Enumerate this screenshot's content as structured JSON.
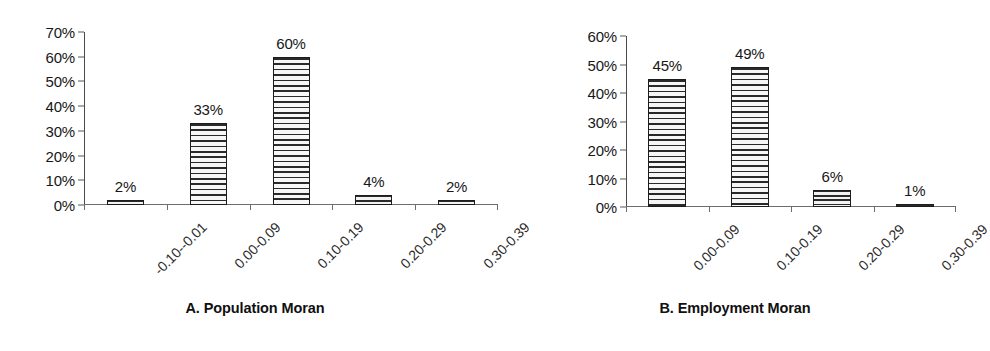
{
  "figure": {
    "background": "#ffffff",
    "bar_fill": "#f7f7f7",
    "bar_hatch_color": "#2a2a2a",
    "bar_border_color": "#1c1c1c",
    "axis_color": "#585858"
  },
  "chart_data": [
    {
      "type": "bar",
      "id": "population-moran",
      "title": "A. Population Moran",
      "xlabel": "",
      "ylabel": "",
      "ylim": [
        0,
        70
      ],
      "ytick_labels": [
        "0%",
        "10%",
        "20%",
        "30%",
        "40%",
        "50%",
        "60%",
        "70%"
      ],
      "ytick_values": [
        0,
        10,
        20,
        30,
        40,
        50,
        60,
        70
      ],
      "grid": false,
      "legend": null,
      "categories": [
        "-0.10--0.01",
        "0.00-0.09",
        "0.10-0.19",
        "0.20-0.29",
        "0.30-0.39"
      ],
      "values": [
        2,
        33,
        60,
        4,
        2
      ],
      "data_labels": [
        "2%",
        "33%",
        "60%",
        "4%",
        "2%"
      ]
    },
    {
      "type": "bar",
      "id": "employment-moran",
      "title": "B. Employment Moran",
      "xlabel": "",
      "ylabel": "",
      "ylim": [
        0,
        60
      ],
      "ytick_labels": [
        "0%",
        "10%",
        "20%",
        "30%",
        "40%",
        "50%",
        "60%"
      ],
      "ytick_values": [
        0,
        10,
        20,
        30,
        40,
        50,
        60
      ],
      "grid": false,
      "legend": null,
      "categories": [
        "0.00-0.09",
        "0.10-0.19",
        "0.20-0.29",
        "0.30-0.39"
      ],
      "values": [
        45,
        49,
        6,
        1
      ],
      "data_labels": [
        "45%",
        "49%",
        "6%",
        "1%"
      ]
    }
  ]
}
